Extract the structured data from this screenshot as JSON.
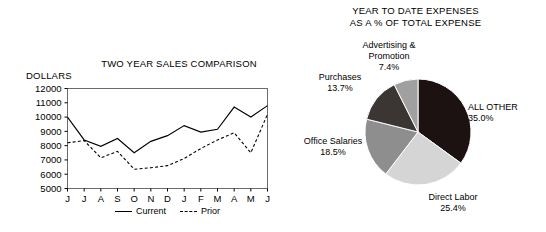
{
  "chart_data": [
    {
      "type": "line",
      "title": "TWO YEAR SALES COMPARISON",
      "ylabel": "DOLLARS",
      "xlabel": "",
      "grid": false,
      "legend_position": "bottom",
      "ylim": [
        5000,
        12000
      ],
      "yticks": [
        12000,
        11000,
        10000,
        9000,
        8000,
        7000,
        6000,
        5000
      ],
      "categories": [
        "J",
        "J",
        "A",
        "S",
        "O",
        "N",
        "D",
        "J",
        "F",
        "M",
        "A",
        "M",
        "J"
      ],
      "series": [
        {
          "name": "Current",
          "style": "solid",
          "values": [
            10000,
            8400,
            7950,
            8500,
            7500,
            8300,
            8700,
            9400,
            8950,
            9150,
            10700,
            10000,
            10800
          ]
        },
        {
          "name": "Prior",
          "style": "dashed",
          "values": [
            8200,
            8350,
            7150,
            7600,
            6350,
            6450,
            6600,
            7100,
            7800,
            8400,
            8900,
            7500,
            10200
          ]
        }
      ]
    },
    {
      "type": "pie",
      "title_line1": "YEAR TO DATE EXPENSES",
      "title_line2": "AS A % OF TOTAL EXPENSE",
      "slices": [
        {
          "label": "ALL OTHER",
          "pct_text": "35.0%",
          "value": 35.0,
          "color": "#1b1211"
        },
        {
          "label": "Direct Labor",
          "pct_text": "25.4%",
          "value": 25.4,
          "color": "#d5d5d5"
        },
        {
          "label": "Office Salaries",
          "pct_text": "18.5%",
          "value": 18.5,
          "color": "#8e8e8e"
        },
        {
          "label": "Purchases",
          "pct_text": "13.7%",
          "value": 13.7,
          "color": "#3b3534"
        },
        {
          "label": "Advertising & Promotion",
          "pct_text": "7.4%",
          "value": 7.4,
          "color": "#a0a0a0"
        }
      ]
    }
  ],
  "line_chart": {
    "title": "TWO YEAR SALES COMPARISON",
    "ylabel": "DOLLARS",
    "ytick_labels": [
      "12000",
      "11000",
      "10000",
      "9000",
      "8000",
      "7000",
      "6000",
      "5000"
    ],
    "xtick_labels": [
      "J",
      "J",
      "A",
      "S",
      "O",
      "N",
      "D",
      "J",
      "F",
      "M",
      "A",
      "M",
      "J"
    ],
    "legend": [
      {
        "label": "Current",
        "style": "solid"
      },
      {
        "label": "Prior",
        "style": "dashed"
      }
    ]
  },
  "pie_chart": {
    "title_line1": "YEAR TO DATE EXPENSES",
    "title_line2": "AS A % OF TOTAL EXPENSE",
    "labels": {
      "advertising": {
        "name_line1": "Advertising &",
        "name_line2": "Promotion",
        "pct": "7.4%"
      },
      "purchases": {
        "name": "Purchases",
        "pct": "13.7%"
      },
      "office_salaries": {
        "name": "Office Salaries",
        "pct": "18.5%"
      },
      "direct_labor": {
        "name": "Direct Labor",
        "pct": "25.4%"
      },
      "all_other": {
        "name": "ALL OTHER",
        "pct": "35.0%"
      }
    }
  },
  "colors": {
    "ink": "#000000",
    "background": "#ffffff",
    "slice_all_other": "#1b1211",
    "slice_direct_labor": "#d5d5d5",
    "slice_office_salaries": "#8e8e8e",
    "slice_purchases": "#3b3534",
    "slice_advertising": "#a0a0a0"
  }
}
